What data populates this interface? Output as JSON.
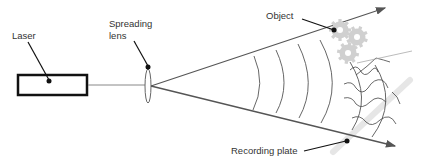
{
  "diagram": {
    "labels": {
      "laser": "Laser",
      "lens_line1": "Spreading",
      "lens_line2": "lens",
      "object": "Object",
      "plate": "Recording plate"
    },
    "colors": {
      "stroke": "#444444",
      "beam": "#555555",
      "gear": "#cfcfcf",
      "plate": "#e6e6e6",
      "text": "#333333"
    }
  }
}
